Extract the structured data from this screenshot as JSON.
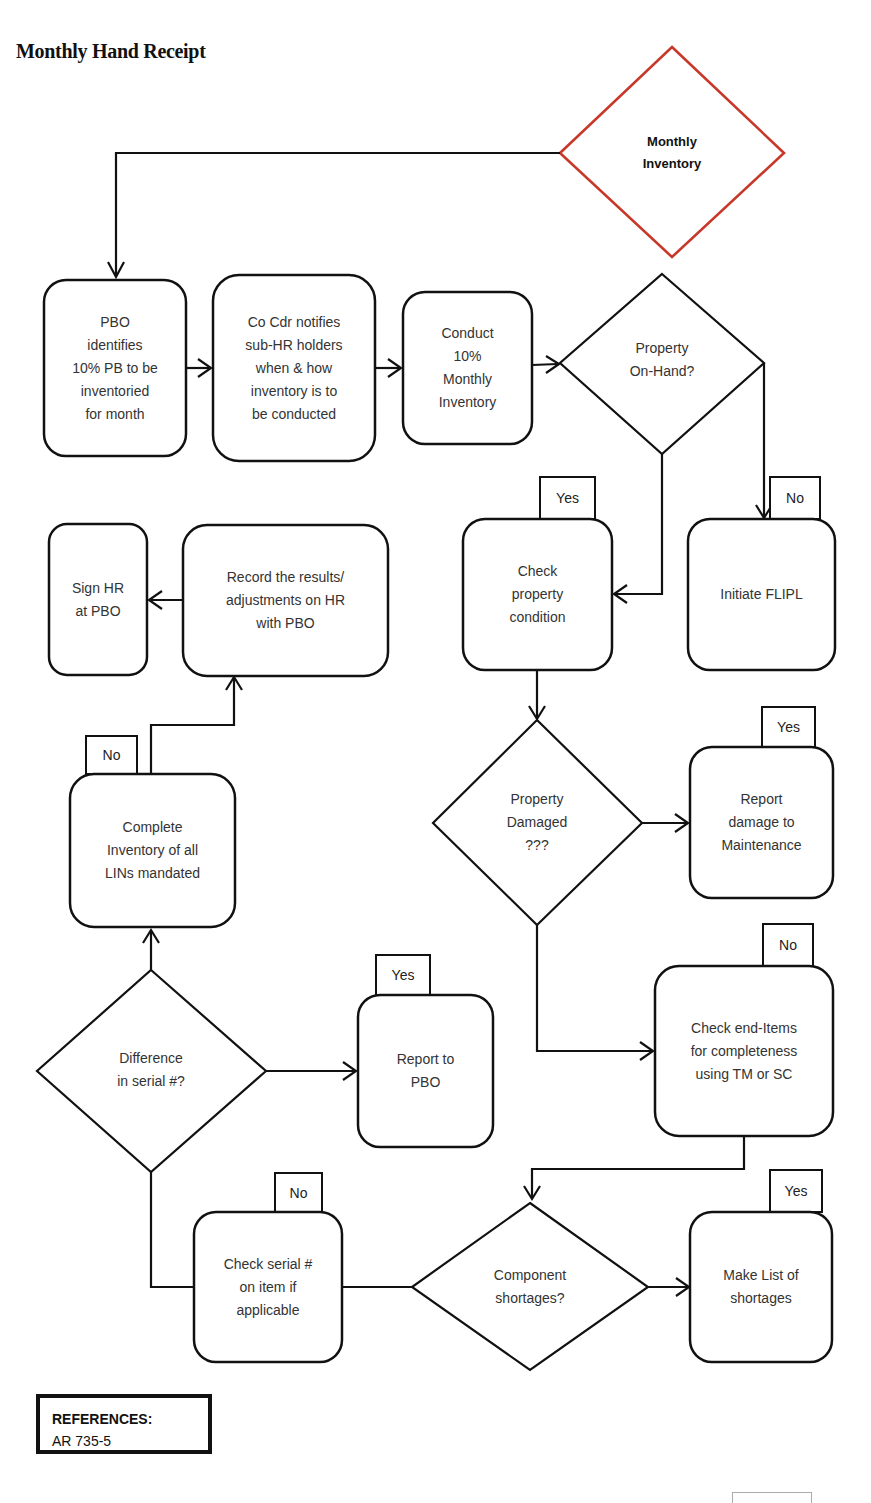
{
  "title": "Monthly Hand Receipt",
  "start": {
    "label": "Monthly\nInventory",
    "color": "#c8382a"
  },
  "nodes": {
    "pbo_identifies": "PBO\nidentifies\n10% PB to be\ninventoried\nfor month",
    "co_cdr_notifies": "Co Cdr notifies\nsub-HR holders\nwhen & how\ninventory is to\nbe conducted",
    "conduct_inventory": "Conduct\n10%\nMonthly\nInventory",
    "property_on_hand": "Property\nOn-Hand?",
    "check_condition": "Check\nproperty\ncondition",
    "initiate_flipl": "Initiate FLIPL",
    "sign_hr": "Sign HR\nat PBO",
    "record_results": "Record the results/\nadjustments on HR\nwith PBO",
    "property_damaged": "Property\nDamaged\n???",
    "report_damage": "Report\ndamage to\nMaintenance",
    "complete_inventory": "Complete\nInventory of all\nLINs mandated",
    "check_end_items": "Check end-Items\nfor completeness\nusing TM or SC",
    "difference_serial": "Difference\nin serial #?",
    "report_pbo": "Report to\nPBO",
    "check_serial": "Check serial #\non item if\napplicable",
    "component_shortages": "Component\nshortages?",
    "make_list": "Make List of\nshortages"
  },
  "tags": {
    "check_condition": "Yes",
    "initiate_flipl": "No",
    "report_damage": "Yes",
    "complete_inventory": "No",
    "check_end_items": "No",
    "report_pbo": "Yes",
    "check_serial": "No",
    "make_list": "Yes"
  },
  "references": {
    "heading": "REFERENCES:",
    "items": [
      "AR 735-5"
    ]
  }
}
